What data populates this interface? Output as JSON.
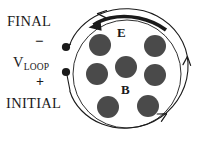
{
  "figure": {
    "background_color": "#ffffff",
    "ink_color": "#1a1a1a",
    "dot_color": "#4a4a4a"
  },
  "labels": {
    "final": "FINAL",
    "initial": "INITIAL",
    "minus": "−",
    "plus": "+",
    "vloop_main": "V",
    "vloop_sub": "LOOP",
    "e_field": "E",
    "b_field": "B"
  },
  "geometry": {
    "loop_center_x": 127,
    "loop_center_y": 72,
    "loop_radius": 62,
    "field_circle_radius": 50,
    "terminal_top": {
      "x": 66,
      "y": 47
    },
    "terminal_bottom": {
      "x": 66,
      "y": 72
    }
  },
  "field_dots": [
    {
      "cx": 100,
      "cy": 45,
      "r": 11
    },
    {
      "cx": 155,
      "cy": 46,
      "r": 11
    },
    {
      "cx": 97,
      "cy": 74,
      "r": 11
    },
    {
      "cx": 126,
      "cy": 67,
      "r": 11
    },
    {
      "cx": 155,
      "cy": 75,
      "r": 11
    },
    {
      "cx": 108,
      "cy": 107,
      "r": 11
    },
    {
      "cx": 148,
      "cy": 106,
      "r": 11
    }
  ],
  "arrows": {
    "loop_arrowhead_top": "counterclockwise-left",
    "loop_arrowhead_right": "upward",
    "loop_arrowhead_bottom": "rightward",
    "e_field_arrow": "thick-leftward-arc"
  }
}
